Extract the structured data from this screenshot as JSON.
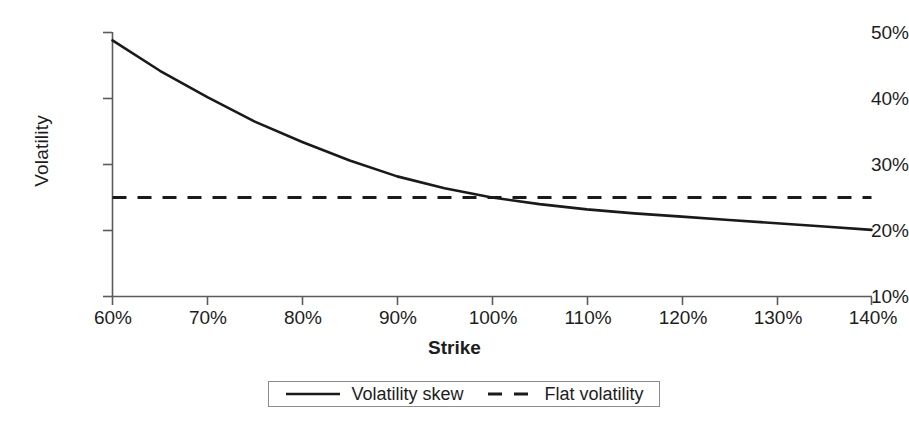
{
  "chart_data": {
    "type": "line",
    "title": "",
    "xlabel": "Strike",
    "ylabel": "Volatility",
    "xlim": [
      60,
      140
    ],
    "ylim": [
      10,
      50
    ],
    "xticks": [
      "60%",
      "70%",
      "80%",
      "90%",
      "100%",
      "110%",
      "120%",
      "130%",
      "140%"
    ],
    "yticks": [
      "10%",
      "20%",
      "30%",
      "40%",
      "50%"
    ],
    "xtick_values": [
      60,
      70,
      80,
      90,
      100,
      110,
      120,
      130,
      140
    ],
    "ytick_values": [
      10,
      20,
      30,
      40,
      50
    ],
    "grid": false,
    "legend_position": "bottom-center",
    "x": [
      60,
      65,
      70,
      75,
      80,
      85,
      90,
      95,
      100,
      105,
      110,
      115,
      120,
      125,
      130,
      135,
      140
    ],
    "series": [
      {
        "name": "Volatility skew",
        "style": "solid",
        "color": "#1a1a1a",
        "values": [
          48.8,
          44.2,
          40.2,
          36.5,
          33.4,
          30.6,
          28.2,
          26.4,
          25.0,
          24.0,
          23.2,
          22.6,
          22.1,
          21.6,
          21.1,
          20.6,
          20.1
        ]
      },
      {
        "name": "Flat volatility",
        "style": "dashed",
        "color": "#1a1a1a",
        "values": [
          25,
          25,
          25,
          25,
          25,
          25,
          25,
          25,
          25,
          25,
          25,
          25,
          25,
          25,
          25,
          25,
          25
        ]
      }
    ],
    "annotations": []
  },
  "legend": {
    "items": [
      {
        "label": "Volatility skew",
        "style": "solid"
      },
      {
        "label": "Flat volatility",
        "style": "dashed"
      }
    ]
  },
  "axes": {
    "x_title": "Strike",
    "y_title": "Volatility"
  },
  "colors": {
    "axis": "#5a5a5a",
    "line": "#1a1a1a",
    "legend_border": "#8c8c8c",
    "background": "#ffffff",
    "text": "#1d1d1d"
  }
}
